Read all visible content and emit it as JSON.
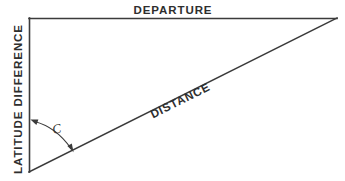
{
  "figure": {
    "background_color": "#ffffff",
    "line_color": "#3b3b3b",
    "text_color": "#2e2e2e",
    "labels": {
      "top_side": "DEPARTURE",
      "left_side": "LATITUDE DIFFERENCE",
      "hypotenuse": "DISTANCE",
      "angle": "C"
    },
    "geometry": {
      "vertex_top_left": [
        29,
        18
      ],
      "vertex_top_right": [
        337,
        18
      ],
      "vertex_bottom_left": [
        29,
        172
      ],
      "hypotenuse_angle_degrees": 26.6,
      "angle_arc_start": [
        32,
        120
      ],
      "angle_arc_end": [
        73,
        151
      ]
    }
  }
}
